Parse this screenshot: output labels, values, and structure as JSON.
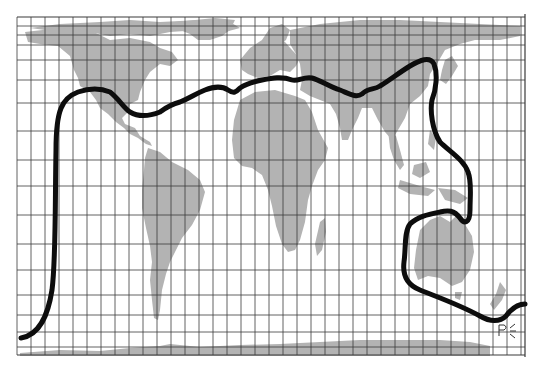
{
  "map": {
    "type": "world map with grid",
    "projection_style": "rectangular grid (Mercator-like)",
    "frame": {
      "x": 17,
      "y": 17,
      "width": 508,
      "height": 338
    },
    "colors": {
      "background": "#ffffff",
      "land": "#b3b3b3",
      "grid": "#3a3a3a",
      "divide_line": "#0d0d0d",
      "signature": "#333333"
    },
    "grid": {
      "vertical_lines_x": [
        17,
        31,
        45,
        59,
        73,
        87,
        101,
        115,
        129,
        143,
        157,
        171,
        185,
        199,
        213,
        227,
        241,
        255,
        269,
        283,
        297,
        311,
        325,
        339,
        353,
        367,
        381,
        395,
        409,
        423,
        437,
        451,
        465,
        479,
        493,
        507,
        521,
        525
      ],
      "horizontal_lines_y": [
        17,
        26,
        35,
        45,
        60,
        80,
        103,
        131,
        160,
        186,
        215,
        244,
        270,
        295,
        315,
        332,
        347,
        355
      ]
    },
    "landmasses": [
      "North America",
      "Greenland",
      "South America",
      "Europe",
      "Africa",
      "Madagascar",
      "Asia",
      "Indian subcontinent",
      "Southeast Asia",
      "Japan",
      "Australia",
      "New Zealand",
      "Antarctica",
      "Arctic islands"
    ],
    "divide_line": {
      "description": "thick black line dividing the globe into two regions",
      "stroke_width": 5
    },
    "signature": "PE"
  }
}
